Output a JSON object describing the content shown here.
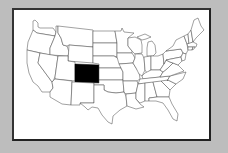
{
  "map": {
    "region": "United States",
    "highlighted_state": "Colorado",
    "highlight_color": "#000000",
    "state_fill": "#ffffff",
    "border_color": "#444444",
    "background_color": "#bdbdbd"
  }
}
